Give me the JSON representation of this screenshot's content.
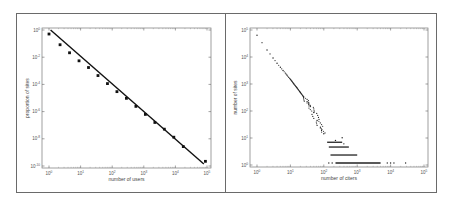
{
  "chart_data": [
    {
      "type": "scatter",
      "panel": "left",
      "title": "",
      "xlabel": "number of users",
      "ylabel": "proportion of sites",
      "xscale": "log",
      "yscale": "log",
      "xlim_exp": [
        0,
        5
      ],
      "ylim_exp": [
        -10,
        0
      ],
      "x_tick_labels": [
        "10^0",
        "10^1",
        "10^2",
        "10^3",
        "10^4",
        "10^5"
      ],
      "y_tick_labels": [
        "10^0",
        "10^-2",
        "10^-4",
        "10^-6",
        "10^-8",
        "10^-10"
      ],
      "grid": false,
      "series": [
        {
          "name": "binned data",
          "marker": "square",
          "points_log10": [
            [
              0.0,
              -0.3
            ],
            [
              0.35,
              -1.1
            ],
            [
              0.65,
              -1.7
            ],
            [
              0.95,
              -2.3
            ],
            [
              1.25,
              -2.8
            ],
            [
              1.55,
              -3.4
            ],
            [
              1.85,
              -4.0
            ],
            [
              2.15,
              -4.6
            ],
            [
              2.45,
              -5.1
            ],
            [
              2.75,
              -5.7
            ],
            [
              3.05,
              -6.3
            ],
            [
              3.35,
              -6.9
            ],
            [
              3.65,
              -7.4
            ],
            [
              3.95,
              -8.0
            ],
            [
              4.25,
              -8.7
            ],
            [
              4.95,
              -9.8
            ]
          ]
        },
        {
          "name": "power-law fit",
          "style": "line",
          "points_log10": [
            [
              0.05,
              0.0
            ],
            [
              4.9,
              -10.0
            ]
          ]
        }
      ]
    },
    {
      "type": "scatter",
      "panel": "right",
      "title": "",
      "xlabel": "number of citers",
      "ylabel": "number of sites",
      "xscale": "log",
      "yscale": "log",
      "xlim_exp": [
        0,
        5
      ],
      "ylim_exp": [
        0,
        5
      ],
      "x_tick_labels": [
        "10^0",
        "10^1",
        "10^2",
        "10^3",
        "10^4",
        "10^5"
      ],
      "y_tick_labels": [
        "10^5",
        "10^4",
        "10^3",
        "10^2",
        "10^1",
        "10^0"
      ],
      "grid": false,
      "series": [
        {
          "name": "sites",
          "marker": "dot",
          "head_points_log10": [
            [
              0.0,
              4.8
            ],
            [
              0.3,
              4.25
            ],
            [
              0.48,
              3.95
            ],
            [
              0.6,
              3.75
            ],
            [
              0.7,
              3.6
            ],
            [
              0.78,
              3.48
            ],
            [
              0.85,
              3.38
            ],
            [
              0.9,
              3.3
            ],
            [
              0.95,
              3.22
            ],
            [
              1.0,
              3.15
            ],
            [
              1.1,
              2.98
            ],
            [
              1.2,
              2.82
            ],
            [
              1.3,
              2.65
            ],
            [
              1.4,
              2.48
            ],
            [
              1.5,
              2.3
            ],
            [
              1.6,
              2.12
            ],
            [
              1.7,
              1.9
            ],
            [
              1.8,
              1.6
            ],
            [
              1.9,
              1.35
            ],
            [
              2.0,
              1.1
            ]
          ],
          "bands_log10": [
            {
              "y": 0.78,
              "x_from": 2.1,
              "x_to": 2.55
            },
            {
              "y": 0.6,
              "x_from": 2.15,
              "x_to": 2.75
            },
            {
              "y": 0.3,
              "x_from": 2.2,
              "x_to": 3.0
            },
            {
              "y": 0.0,
              "x_from": 2.35,
              "x_to": 3.7
            }
          ],
          "outliers_log10": [
            [
              2.15,
              0.0
            ],
            [
              2.25,
              0.0
            ],
            [
              3.9,
              0.0
            ],
            [
              4.0,
              0.0
            ],
            [
              4.1,
              0.0
            ],
            [
              4.45,
              0.0
            ],
            [
              2.55,
              0.95
            ],
            [
              2.35,
              0.85
            ],
            [
              2.6,
              0.72
            ]
          ]
        }
      ]
    }
  ]
}
